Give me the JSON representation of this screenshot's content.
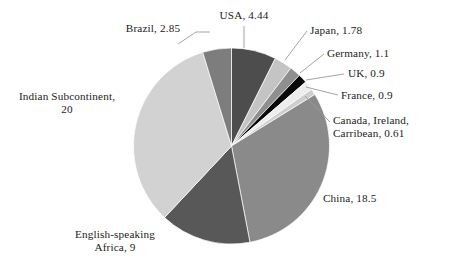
{
  "chart_data": {
    "type": "pie",
    "title": "",
    "subtitle": "",
    "xlabel": "",
    "ylabel": "",
    "legend": "none",
    "grid": false,
    "units": "millions",
    "total": 60.08,
    "start_angle_deg": 0,
    "direction": "clockwise",
    "categories": [
      "USA",
      "Japan",
      "Germany",
      "UK",
      "France",
      "Canada, Ireland, Carribean",
      "China",
      "English-speaking Africa",
      "Indian Subcontinent",
      "Brazil"
    ],
    "values": [
      4.44,
      1.78,
      1.1,
      0.9,
      0.9,
      0.61,
      18.5,
      9,
      20,
      2.85
    ],
    "slices": [
      {
        "name": "USA",
        "value": 4.44,
        "value_text": "4.44",
        "label": "USA, 4.44",
        "color": "#4d4d4d"
      },
      {
        "name": "Japan",
        "value": 1.78,
        "value_text": "1.78",
        "label": "Japan, 1.78",
        "color": "#c4c4c4"
      },
      {
        "name": "Germany",
        "value": 1.1,
        "value_text": "1.1",
        "label": "Germany, 1.1",
        "color": "#8f8f8f"
      },
      {
        "name": "UK",
        "value": 0.9,
        "value_text": "0.9",
        "label": "UK, 0.9",
        "color": "#0a0a0a"
      },
      {
        "name": "France",
        "value": 0.9,
        "value_text": "0.9",
        "label": "France, 0.9",
        "color": "#ededed"
      },
      {
        "name": "Canada, Ireland, Carribean",
        "value": 0.61,
        "value_text": "0.61",
        "label": "Canada, Ireland, Carribean, 0.61",
        "color": "#cfcfcf"
      },
      {
        "name": "China",
        "value": 18.5,
        "value_text": "18.5",
        "label": "China, 18.5",
        "color": "#8a8a8a"
      },
      {
        "name": "English-speaking Africa",
        "value": 9,
        "value_text": "9",
        "label": "English-speaking Africa, 9",
        "color": "#585858"
      },
      {
        "name": "Indian Subcontinent",
        "value": 20,
        "value_text": "20",
        "label": "Indian Subcontinent, 20",
        "color": "#d2d2d2"
      },
      {
        "name": "Brazil",
        "value": 2.85,
        "value_text": "2.85",
        "label": "Brazil, 2.85",
        "color": "#7d7d7d"
      }
    ]
  },
  "labels": {
    "usa": "USA, 4.44",
    "japan": "Japan, 1.78",
    "germany": "Germany, 1.1",
    "uk": "UK, 0.9",
    "france": "France, 0.9",
    "canada_line1": "Canada, Ireland,",
    "canada_line2": "Carribean, 0.61",
    "china": "China, 18.5",
    "africa_line1": "English-speaking",
    "africa_line2": "Africa, 9",
    "indian_line1": "Indian Subcontinent,",
    "indian_line2": "20",
    "brazil": "Brazil, 2.85"
  },
  "colors": {
    "background": "#ffffff",
    "text": "#1b1b1b",
    "leader_line": "#9a9a9a",
    "slice_edge": "#ffffff"
  }
}
